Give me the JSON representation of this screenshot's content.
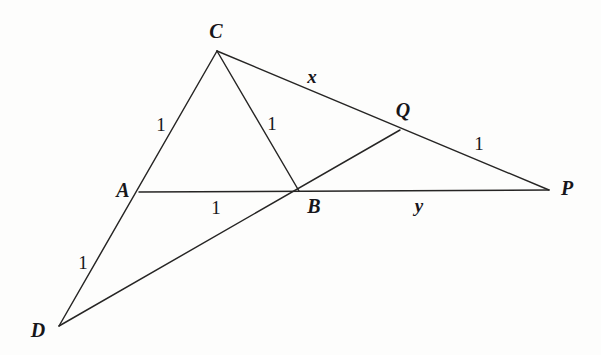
{
  "figure": {
    "kind": "geometry-diagram",
    "background_color": "#fdfdfc",
    "stroke_color": "#262524",
    "label_color": "#17161a",
    "width": 601,
    "height": 355,
    "vertices": [
      {
        "id": "C",
        "label": "C",
        "x": 217,
        "y": 51,
        "label_x": 216,
        "label_y": 31
      },
      {
        "id": "A",
        "label": "A",
        "x": 139,
        "y": 192,
        "label_x": 123,
        "label_y": 190
      },
      {
        "id": "B",
        "label": "B",
        "x": 299,
        "y": 191,
        "label_x": 314,
        "label_y": 206
      },
      {
        "id": "P",
        "label": "P",
        "x": 549,
        "y": 190,
        "label_x": 567,
        "label_y": 188
      },
      {
        "id": "Q",
        "label": "Q",
        "x": 400,
        "y": 130,
        "label_x": 403,
        "label_y": 110
      },
      {
        "id": "D",
        "label": "D",
        "x": 59,
        "y": 326,
        "label_x": 38,
        "label_y": 330
      }
    ],
    "edges": [
      {
        "id": "DC",
        "from": "D",
        "to": "C",
        "through": "A"
      },
      {
        "id": "CP",
        "from": "C",
        "to": "P",
        "through": "Q"
      },
      {
        "id": "CB",
        "from": "C",
        "to": "B"
      },
      {
        "id": "AP",
        "from": "A",
        "to": "P",
        "through": "B"
      },
      {
        "id": "DQ",
        "from": "D",
        "to": "Q",
        "through": "B"
      }
    ],
    "segment_labels": [
      {
        "id": "len-AC",
        "segment": "AC",
        "text": "1",
        "x": 161,
        "y": 124,
        "style": "measure"
      },
      {
        "id": "len-CB",
        "segment": "CB",
        "text": "1",
        "x": 272,
        "y": 123,
        "style": "measure"
      },
      {
        "id": "len-AB",
        "segment": "AB",
        "text": "1",
        "x": 216,
        "y": 207,
        "style": "measure"
      },
      {
        "id": "len-DA",
        "segment": "DA",
        "text": "1",
        "x": 83,
        "y": 262,
        "style": "measure"
      },
      {
        "id": "len-QP",
        "segment": "QP",
        "text": "1",
        "x": 479,
        "y": 143,
        "style": "measure"
      },
      {
        "id": "len-CQ",
        "segment": "CQ",
        "text": "x",
        "x": 312,
        "y": 76,
        "style": "variable"
      },
      {
        "id": "len-BP",
        "segment": "BP",
        "text": "y",
        "x": 419,
        "y": 205,
        "style": "variable"
      }
    ]
  }
}
